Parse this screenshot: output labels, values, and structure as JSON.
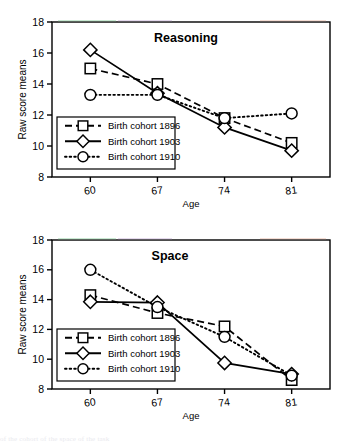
{
  "figure": {
    "background_color": "#ffffff",
    "axis_color": "#000000",
    "y_axis_label": "Raw score means",
    "x_axis_label": "Age",
    "y_ticks": [
      18,
      16,
      14,
      12,
      10,
      8
    ],
    "x_ticks": [
      60,
      67,
      74,
      81
    ],
    "legend": {
      "entries": [
        {
          "label": "Birth cohort 1896",
          "marker": "square-marker",
          "line_style": "dashed"
        },
        {
          "label": "Birth cohort 1903",
          "marker": "diamond-marker",
          "line_style": "solid"
        },
        {
          "label": "Birth cohort 1910",
          "marker": "circle-marker",
          "line_style": "dotted"
        }
      ]
    },
    "footer_text": "of the cohort of the space of the task"
  },
  "chart_data": [
    {
      "type": "line",
      "title": "Reasoning",
      "xlabel": "Age",
      "ylabel": "Raw score means",
      "x": [
        60,
        67,
        74,
        81
      ],
      "xlim": [
        56,
        85
      ],
      "ylim": [
        8,
        18
      ],
      "yticks": [
        8,
        10,
        12,
        14,
        16,
        18
      ],
      "xticks": [
        60,
        67,
        74,
        81
      ],
      "grid": false,
      "legend_position": "lower-left-inside",
      "series": [
        {
          "name": "Birth cohort 1896",
          "marker": "square",
          "line_style": "dashed",
          "values": [
            15.0,
            14.0,
            11.8,
            10.2
          ]
        },
        {
          "name": "Birth cohort 1903",
          "marker": "diamond",
          "line_style": "solid",
          "values": [
            16.2,
            13.4,
            11.2,
            9.7
          ]
        },
        {
          "name": "Birth cohort 1910",
          "marker": "circle",
          "line_style": "dotted",
          "values": [
            13.3,
            13.3,
            11.8,
            12.1
          ]
        }
      ]
    },
    {
      "type": "line",
      "title": "Space",
      "xlabel": "Age",
      "ylabel": "Raw score means",
      "x": [
        60,
        67,
        74,
        81
      ],
      "xlim": [
        56,
        85
      ],
      "ylim": [
        8,
        18
      ],
      "yticks": [
        8,
        10,
        12,
        14,
        16,
        18
      ],
      "xticks": [
        60,
        67,
        74,
        81
      ],
      "grid": false,
      "legend_position": "lower-left-inside",
      "series": [
        {
          "name": "Birth cohort 1896",
          "marker": "square",
          "line_style": "dashed",
          "values": [
            14.3,
            13.1,
            12.2,
            8.6
          ]
        },
        {
          "name": "Birth cohort 1903",
          "marker": "diamond",
          "line_style": "solid",
          "values": [
            13.85,
            13.8,
            9.75,
            9.0
          ]
        },
        {
          "name": "Birth cohort 1910",
          "marker": "circle",
          "line_style": "dotted",
          "values": [
            16.0,
            13.5,
            11.5,
            8.9
          ]
        }
      ]
    }
  ]
}
